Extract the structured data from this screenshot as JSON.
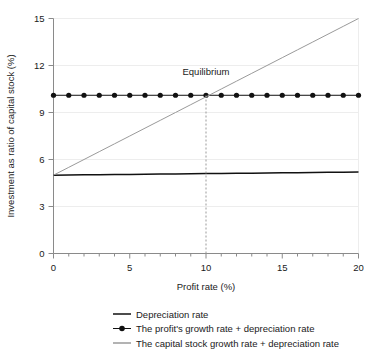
{
  "chart_data": {
    "type": "line",
    "title": "",
    "xlabel": "Profit rate (%)",
    "ylabel": "Investment as ratio of capital stock (%)",
    "xlim": [
      0,
      20
    ],
    "ylim": [
      0,
      15
    ],
    "xticks": [
      0,
      5,
      10,
      15,
      20
    ],
    "xtick_labels": [
      "0",
      "5",
      "10",
      "15",
      "20"
    ],
    "xminor_step": 1,
    "yticks": [
      0,
      3,
      6,
      9,
      12,
      15
    ],
    "ytick_labels": [
      "0",
      "3",
      "6",
      "9",
      "12",
      "15"
    ],
    "grid": "horizontal-minor-light",
    "legend_position": "below",
    "annotations": [
      {
        "text": "Equilibrium",
        "x": 10,
        "y": 11.4
      }
    ],
    "equilibrium": {
      "x": 10,
      "y": 10.1,
      "dashed_vline": true
    },
    "x": [
      0,
      1,
      2,
      3,
      4,
      5,
      6,
      7,
      8,
      9,
      10,
      11,
      12,
      13,
      14,
      15,
      16,
      17,
      18,
      19,
      20
    ],
    "series": [
      {
        "name": "Depreciation rate",
        "color": "#111111",
        "marker": "none",
        "values": [
          5.0,
          5.01,
          5.02,
          5.03,
          5.04,
          5.05,
          5.06,
          5.07,
          5.08,
          5.09,
          5.1,
          5.11,
          5.12,
          5.13,
          5.14,
          5.15,
          5.16,
          5.17,
          5.18,
          5.19,
          5.2
        ]
      },
      {
        "name": "The profit's growth rate + depreciation rate",
        "color": "#111111",
        "marker": "circle",
        "values": [
          10.1,
          10.1,
          10.1,
          10.1,
          10.1,
          10.1,
          10.1,
          10.1,
          10.1,
          10.1,
          10.1,
          10.1,
          10.1,
          10.1,
          10.1,
          10.1,
          10.1,
          10.1,
          10.1,
          10.1,
          10.1
        ]
      },
      {
        "name": "The capital stock growth rate + depreciation rate",
        "color": "#9a9a9a",
        "marker": "none",
        "values": [
          5.0,
          5.5,
          6.0,
          6.5,
          7.0,
          7.5,
          8.0,
          8.5,
          9.0,
          9.5,
          10.0,
          10.5,
          11.0,
          11.5,
          12.0,
          12.5,
          13.0,
          13.5,
          14.0,
          14.5,
          15.0
        ]
      }
    ]
  },
  "legend": {
    "items": [
      {
        "label": "Depreciation rate",
        "marker": "line",
        "color": "#111111"
      },
      {
        "label": "The profit's growth rate + depreciation rate",
        "marker": "line-dot",
        "color": "#111111"
      },
      {
        "label": "The capital stock growth rate + depreciation rate",
        "marker": "line",
        "color": "#9a9a9a"
      }
    ]
  }
}
